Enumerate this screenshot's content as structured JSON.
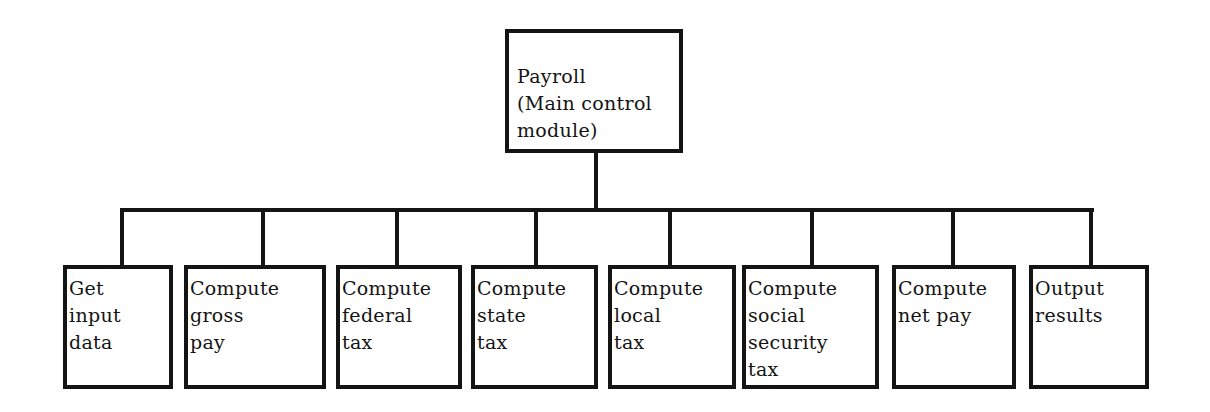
{
  "diagram": {
    "type": "hierarchy-chart",
    "root": {
      "label": "Payroll\n(Main control\nmodule)"
    },
    "children": [
      {
        "label": "Get\ninput\ndata"
      },
      {
        "label": "Compute\ngross\npay"
      },
      {
        "label": "Compute\nfederal\ntax"
      },
      {
        "label": "Compute\nstate\ntax"
      },
      {
        "label": "Compute\nlocal\ntax"
      },
      {
        "label": "Compute\nsocial\nsecurity\ntax"
      },
      {
        "label": "Compute\nnet pay"
      },
      {
        "label": "Output\nresults"
      }
    ],
    "colors": {
      "stroke": "#141414",
      "background": "#ffffff"
    }
  }
}
